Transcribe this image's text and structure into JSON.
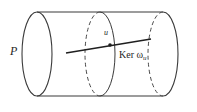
{
  "figure": {
    "type": "diagram",
    "background_color": "#ffffff",
    "stroke_color": "#333333",
    "labels": {
      "bundle": "P",
      "point": "u",
      "kernel_prefix": "Ker ",
      "kernel_omega": "ω",
      "kernel_subscript": "u"
    },
    "geometry": {
      "left_ellipse": {
        "cx": 37,
        "cy": 54,
        "rx": 15,
        "ry": 42,
        "style": "solid"
      },
      "middle_ellipse": {
        "cx": 100,
        "cy": 54,
        "rx": 15,
        "ry": 42,
        "front_style": "solid",
        "back_style": "dashed"
      },
      "right_ellipse": {
        "cx": 163,
        "cy": 54,
        "rx": 15,
        "ry": 42,
        "front_style": "solid",
        "back_style": "dashed"
      },
      "top_edge": {
        "x1": 37,
        "y1": 12,
        "x2": 163,
        "y2": 12
      },
      "bottom_edge": {
        "x1": 37,
        "y1": 96,
        "x2": 163,
        "y2": 96
      },
      "kernel_line": {
        "x1": 66,
        "y1": 53,
        "x2": 151,
        "y2": 39
      },
      "marked_point": {
        "cx": 110,
        "cy": 45,
        "r": 1.6
      }
    }
  }
}
